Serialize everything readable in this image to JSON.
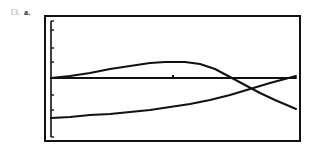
{
  "problem": {
    "number": "13.",
    "part": "a."
  },
  "chart_data": {
    "type": "line",
    "title": "",
    "xlabel": "",
    "ylabel": "",
    "grid": false,
    "legend": "none",
    "frame": {
      "x0": 45,
      "y0": 16,
      "x1": 300,
      "y1": 141
    },
    "axes": {
      "x_axis_y": 78,
      "y_axis_x": 51,
      "y_ticks_px": [
        30,
        48,
        62,
        95,
        110
      ]
    },
    "series": [
      {
        "name": "hump-curve",
        "points_px": [
          [
            51,
            78
          ],
          [
            70,
            76
          ],
          [
            90,
            73
          ],
          [
            110,
            69
          ],
          [
            130,
            66
          ],
          [
            150,
            63
          ],
          [
            165,
            62
          ],
          [
            185,
            62
          ],
          [
            200,
            64
          ],
          [
            215,
            69
          ],
          [
            230,
            77
          ],
          [
            245,
            85
          ],
          [
            260,
            93
          ],
          [
            275,
            100
          ],
          [
            296,
            109
          ]
        ]
      },
      {
        "name": "rising-curve",
        "points_px": [
          [
            51,
            118
          ],
          [
            70,
            117
          ],
          [
            90,
            115
          ],
          [
            110,
            114
          ],
          [
            130,
            112
          ],
          [
            150,
            110
          ],
          [
            170,
            107
          ],
          [
            190,
            104
          ],
          [
            210,
            100
          ],
          [
            230,
            95
          ],
          [
            250,
            89
          ],
          [
            270,
            83
          ],
          [
            296,
            76
          ]
        ]
      },
      {
        "name": "horizontal-line",
        "points_px": [
          [
            51,
            78
          ],
          [
            296,
            78
          ]
        ]
      }
    ],
    "annotations": [
      {
        "type": "tick-dot",
        "x_px": 173,
        "y_px": 77
      }
    ]
  },
  "colors": {
    "ink": "#111111",
    "background": "#ffffff"
  }
}
